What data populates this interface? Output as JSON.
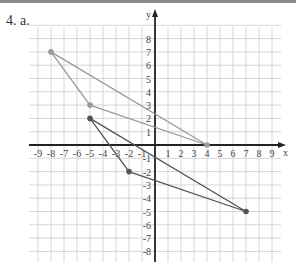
{
  "problem_label": "4. a.",
  "chart_data": {
    "type": "scatter",
    "title": "",
    "xlabel": "x",
    "ylabel": "y",
    "xlim": [
      -9,
      9
    ],
    "ylim": [
      -8,
      8
    ],
    "grid": true,
    "x_ticks": [
      -9,
      -8,
      -7,
      -6,
      -5,
      -4,
      -3,
      -2,
      -1,
      1,
      2,
      3,
      4,
      5,
      6,
      7,
      8,
      9
    ],
    "y_ticks": [
      8,
      7,
      6,
      5,
      4,
      3,
      2,
      1,
      -1,
      -2,
      -3,
      -4,
      -5,
      -6,
      -7,
      -8
    ],
    "series": [
      {
        "name": "Triangle 1",
        "color": "#9a9a9a",
        "points": [
          [
            -8,
            7
          ],
          [
            4,
            0
          ],
          [
            -5,
            3
          ]
        ],
        "closed": true
      },
      {
        "name": "Triangle 2",
        "color": "#555555",
        "points": [
          [
            -5,
            2
          ],
          [
            7,
            -5
          ],
          [
            -2,
            -2
          ]
        ],
        "closed": true
      }
    ]
  },
  "colors": {
    "grid": "#d6d6d6",
    "axis": "#222222",
    "topbar": "#8c8c8c"
  }
}
